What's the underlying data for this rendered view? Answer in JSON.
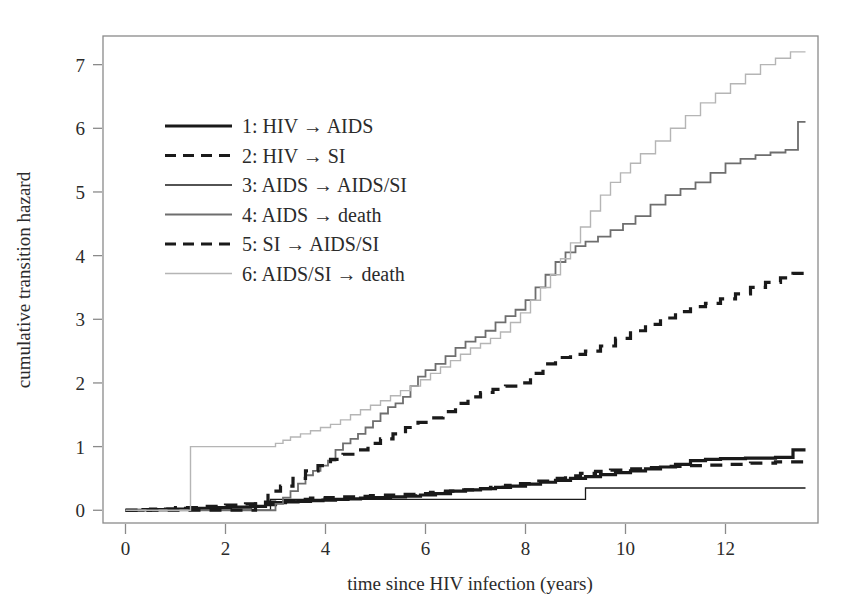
{
  "chart_data": {
    "type": "line",
    "title": "",
    "xlabel": "time since HIV infection (years)",
    "ylabel": "cumulative transition hazard",
    "xlim": [
      -0.45,
      13.85
    ],
    "ylim": [
      -0.2,
      7.45
    ],
    "xticks": [
      0,
      2,
      4,
      6,
      8,
      10,
      12
    ],
    "xtick_labels": [
      "0",
      "2",
      "4",
      "6",
      "8",
      "10",
      "12"
    ],
    "yticks": [
      0,
      1,
      2,
      3,
      4,
      5,
      6,
      7
    ],
    "ytick_labels": [
      "0",
      "1",
      "2",
      "3",
      "4",
      "5",
      "6",
      "7"
    ],
    "grid": false,
    "legend_position": "upper-left-inside",
    "step_type": "post",
    "series": [
      {
        "id": 1,
        "name": "1: HIV → AIDS",
        "style": "solid",
        "color": "#1a1a1a",
        "width": 3.2,
        "x": [
          0.0,
          0.35,
          0.8,
          1.2,
          1.7,
          2.1,
          2.5,
          2.8,
          3.0,
          3.2,
          3.45,
          3.7,
          3.95,
          4.2,
          4.45,
          4.7,
          5.0,
          5.3,
          5.6,
          5.9,
          6.2,
          6.5,
          6.8,
          7.1,
          7.4,
          7.7,
          8.0,
          8.3,
          8.6,
          8.9,
          9.2,
          9.5,
          9.8,
          10.1,
          10.4,
          10.7,
          11.0,
          11.3,
          11.6,
          11.9,
          12.4,
          13.0,
          13.35,
          13.6
        ],
        "y": [
          0.0,
          0.01,
          0.02,
          0.03,
          0.04,
          0.05,
          0.06,
          0.09,
          0.12,
          0.13,
          0.14,
          0.15,
          0.16,
          0.17,
          0.18,
          0.19,
          0.2,
          0.21,
          0.22,
          0.24,
          0.26,
          0.3,
          0.32,
          0.34,
          0.36,
          0.38,
          0.41,
          0.44,
          0.47,
          0.5,
          0.53,
          0.56,
          0.59,
          0.62,
          0.65,
          0.68,
          0.72,
          0.78,
          0.8,
          0.81,
          0.82,
          0.83,
          0.95,
          0.95
        ]
      },
      {
        "id": 2,
        "name": "2: HIV → SI",
        "style": "dashed",
        "color": "#1a1a1a",
        "width": 3.2,
        "x": [
          0.0,
          0.5,
          1.0,
          1.5,
          2.0,
          2.4,
          2.8,
          3.1,
          3.4,
          3.7,
          4.0,
          4.3,
          4.6,
          4.9,
          5.2,
          5.5,
          5.8,
          6.1,
          6.4,
          6.7,
          7.0,
          7.3,
          7.6,
          7.9,
          8.2,
          8.5,
          8.8,
          9.1,
          9.4,
          9.7,
          10.0,
          10.4,
          10.8,
          11.2,
          11.6,
          12.0,
          12.5,
          13.0,
          13.6
        ],
        "y": [
          0.0,
          0.02,
          0.04,
          0.06,
          0.08,
          0.1,
          0.13,
          0.15,
          0.17,
          0.19,
          0.2,
          0.21,
          0.22,
          0.23,
          0.24,
          0.25,
          0.26,
          0.28,
          0.3,
          0.32,
          0.34,
          0.36,
          0.39,
          0.42,
          0.46,
          0.5,
          0.54,
          0.58,
          0.61,
          0.63,
          0.65,
          0.67,
          0.69,
          0.7,
          0.71,
          0.72,
          0.74,
          0.76,
          0.78
        ]
      },
      {
        "id": 3,
        "name": "3: AIDS → AIDS/SI",
        "style": "solid",
        "color": "#1a1a1a",
        "width": 1.3,
        "x": [
          0.0,
          2.85,
          2.9,
          9.15,
          9.2,
          13.6
        ],
        "y": [
          0.0,
          0.0,
          0.17,
          0.17,
          0.35,
          0.35
        ]
      },
      {
        "id": 4,
        "name": "4: AIDS → death",
        "style": "solid",
        "color": "#6e6e6e",
        "width": 1.8,
        "x": [
          0.0,
          2.85,
          3.0,
          3.15,
          3.3,
          3.45,
          3.6,
          3.75,
          3.9,
          4.05,
          4.2,
          4.35,
          4.5,
          4.65,
          4.8,
          4.95,
          5.1,
          5.25,
          5.4,
          5.55,
          5.7,
          5.85,
          6.0,
          6.2,
          6.4,
          6.6,
          6.8,
          7.0,
          7.2,
          7.4,
          7.6,
          7.8,
          8.0,
          8.2,
          8.4,
          8.6,
          8.8,
          9.0,
          9.2,
          9.45,
          9.7,
          9.95,
          10.2,
          10.5,
          10.8,
          11.1,
          11.4,
          11.7,
          12.0,
          12.3,
          12.6,
          12.9,
          13.2,
          13.45,
          13.6
        ],
        "y": [
          0.0,
          0.0,
          0.1,
          0.2,
          0.3,
          0.42,
          0.55,
          0.62,
          0.7,
          0.78,
          0.95,
          1.05,
          1.12,
          1.2,
          1.3,
          1.4,
          1.52,
          1.62,
          1.68,
          1.78,
          1.95,
          2.1,
          2.2,
          2.3,
          2.42,
          2.55,
          2.65,
          2.72,
          2.82,
          2.95,
          3.05,
          3.15,
          3.3,
          3.5,
          3.7,
          3.9,
          4.05,
          4.15,
          4.22,
          4.3,
          4.4,
          4.5,
          4.62,
          4.8,
          4.95,
          5.05,
          5.15,
          5.3,
          5.45,
          5.52,
          5.58,
          5.62,
          5.66,
          6.1,
          6.1
        ]
      },
      {
        "id": 5,
        "name": "5: SI → AIDS/SI",
        "style": "dashed",
        "color": "#1a1a1a",
        "width": 3.2,
        "x": [
          0.0,
          2.4,
          2.6,
          2.85,
          3.1,
          3.35,
          3.6,
          3.85,
          4.1,
          4.35,
          4.6,
          4.85,
          5.1,
          5.35,
          5.6,
          5.85,
          6.1,
          6.35,
          6.6,
          6.85,
          7.1,
          7.35,
          7.6,
          7.85,
          8.1,
          8.35,
          8.6,
          8.9,
          9.2,
          9.5,
          9.8,
          10.1,
          10.4,
          10.7,
          11.0,
          11.3,
          11.6,
          11.9,
          12.2,
          12.5,
          12.8,
          13.1,
          13.35,
          13.6
        ],
        "y": [
          0.0,
          0.0,
          0.1,
          0.3,
          0.38,
          0.5,
          0.62,
          0.7,
          0.8,
          0.88,
          0.95,
          1.05,
          1.12,
          1.2,
          1.3,
          1.38,
          1.45,
          1.55,
          1.68,
          1.78,
          1.85,
          1.9,
          1.95,
          2.0,
          2.15,
          2.3,
          2.4,
          2.45,
          2.5,
          2.58,
          2.7,
          2.82,
          2.92,
          3.02,
          3.12,
          3.2,
          3.25,
          3.32,
          3.4,
          3.5,
          3.58,
          3.65,
          3.72,
          3.75
        ]
      },
      {
        "id": 6,
        "name": "6: AIDS/SI → death",
        "style": "solid",
        "color": "#b5b5b5",
        "width": 1.4,
        "x": [
          0.0,
          1.28,
          1.3,
          2.88,
          3.0,
          3.15,
          3.3,
          3.5,
          3.7,
          3.9,
          4.1,
          4.3,
          4.5,
          4.7,
          4.9,
          5.1,
          5.3,
          5.5,
          5.7,
          5.9,
          6.1,
          6.3,
          6.5,
          6.7,
          6.9,
          7.1,
          7.3,
          7.5,
          7.7,
          7.9,
          8.1,
          8.3,
          8.5,
          8.7,
          8.9,
          9.1,
          9.3,
          9.5,
          9.7,
          9.9,
          10.1,
          10.3,
          10.6,
          10.9,
          11.2,
          11.5,
          11.8,
          12.1,
          12.4,
          12.7,
          13.0,
          13.3,
          13.6
        ],
        "y": [
          0.0,
          0.0,
          1.0,
          1.0,
          1.05,
          1.1,
          1.15,
          1.2,
          1.25,
          1.3,
          1.35,
          1.42,
          1.5,
          1.58,
          1.65,
          1.72,
          1.8,
          1.88,
          1.95,
          2.05,
          2.15,
          2.25,
          2.35,
          2.45,
          2.55,
          2.62,
          2.7,
          2.8,
          2.95,
          3.1,
          3.3,
          3.5,
          3.7,
          3.95,
          4.2,
          4.45,
          4.7,
          4.95,
          5.15,
          5.3,
          5.45,
          5.6,
          5.8,
          6.0,
          6.2,
          6.4,
          6.55,
          6.7,
          6.85,
          7.0,
          7.1,
          7.2,
          7.2
        ]
      }
    ]
  },
  "legend": {
    "entries": [
      {
        "label": "1: HIV → AIDS"
      },
      {
        "label": "2: HIV → SI"
      },
      {
        "label": "3: AIDS → AIDS/SI"
      },
      {
        "label": "4: AIDS → death"
      },
      {
        "label": "5: SI → AIDS/SI"
      },
      {
        "label": "6: AIDS/SI → death"
      }
    ]
  }
}
